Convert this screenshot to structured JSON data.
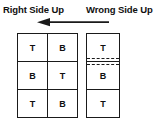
{
  "headers": {
    "left": "Right Side Up",
    "right": "Wrong Side Up"
  },
  "arrow": {
    "name": "left-pointing-arrow",
    "direction": "left",
    "color": "#1a1a1a"
  },
  "colors": {
    "background": "#ffffff",
    "ink": "#1a1a1a",
    "line": "#101010"
  },
  "diagram": {
    "left_stack": {
      "name": "right-side-up-stack",
      "columns": 2,
      "rows": [
        [
          "T",
          "B"
        ],
        [
          "B",
          "T"
        ],
        [
          "T",
          "B"
        ]
      ]
    },
    "right_stack": {
      "name": "wrong-side-up-stack",
      "columns": 1,
      "rows": [
        "T",
        "B",
        "T"
      ],
      "fold_lines": [
        "dashed",
        "dashed"
      ]
    }
  }
}
